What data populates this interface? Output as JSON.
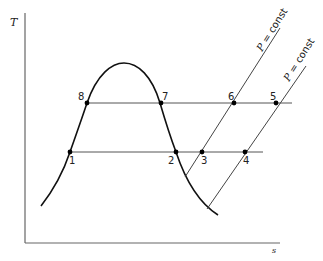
{
  "diagram": {
    "axes": {
      "y_label": "T",
      "x_label": "s"
    },
    "isobars": [
      {
        "label_symbol": "P",
        "label_rest": " = const"
      },
      {
        "label_symbol": "P",
        "label_rest": " = const"
      }
    ],
    "state_points": [
      {
        "id": "1",
        "label": "1"
      },
      {
        "id": "2",
        "label": "2"
      },
      {
        "id": "3",
        "label": "3"
      },
      {
        "id": "4",
        "label": "4"
      },
      {
        "id": "5",
        "label": "5"
      },
      {
        "id": "6",
        "label": "6"
      },
      {
        "id": "7",
        "label": "7"
      },
      {
        "id": "8",
        "label": "8"
      }
    ]
  }
}
